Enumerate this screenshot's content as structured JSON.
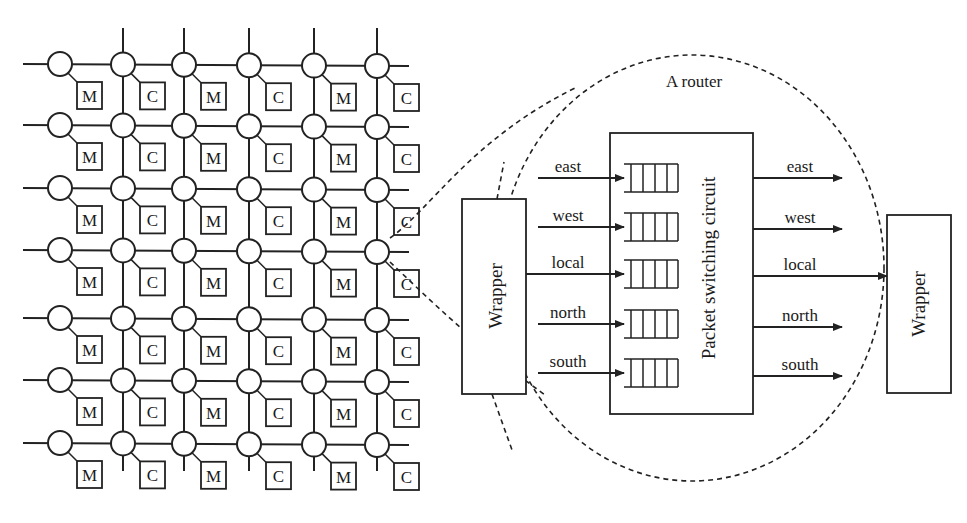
{
  "mesh": {
    "rows": 7,
    "cols": 6,
    "col_x": [
      60,
      123,
      184,
      249,
      314,
      377
    ],
    "row_y": [
      64,
      125,
      188,
      250,
      318,
      380,
      443
    ],
    "tile_labels": [
      "M",
      "C",
      "M",
      "C",
      "M",
      "C"
    ]
  },
  "router_detail": {
    "title": "A router",
    "core_label": "Packet switching circuit",
    "left_wrapper_label": "Wrapper",
    "right_wrapper_label": "Wrapper",
    "inputs": [
      {
        "label": "east"
      },
      {
        "label": "west"
      },
      {
        "label": "local"
      },
      {
        "label": "north"
      },
      {
        "label": "south"
      }
    ],
    "outputs": [
      {
        "label": "east"
      },
      {
        "label": "west"
      },
      {
        "label": "local"
      },
      {
        "label": "north"
      },
      {
        "label": "south"
      }
    ]
  },
  "colors": {
    "stroke": "#222222",
    "background": "#ffffff"
  }
}
